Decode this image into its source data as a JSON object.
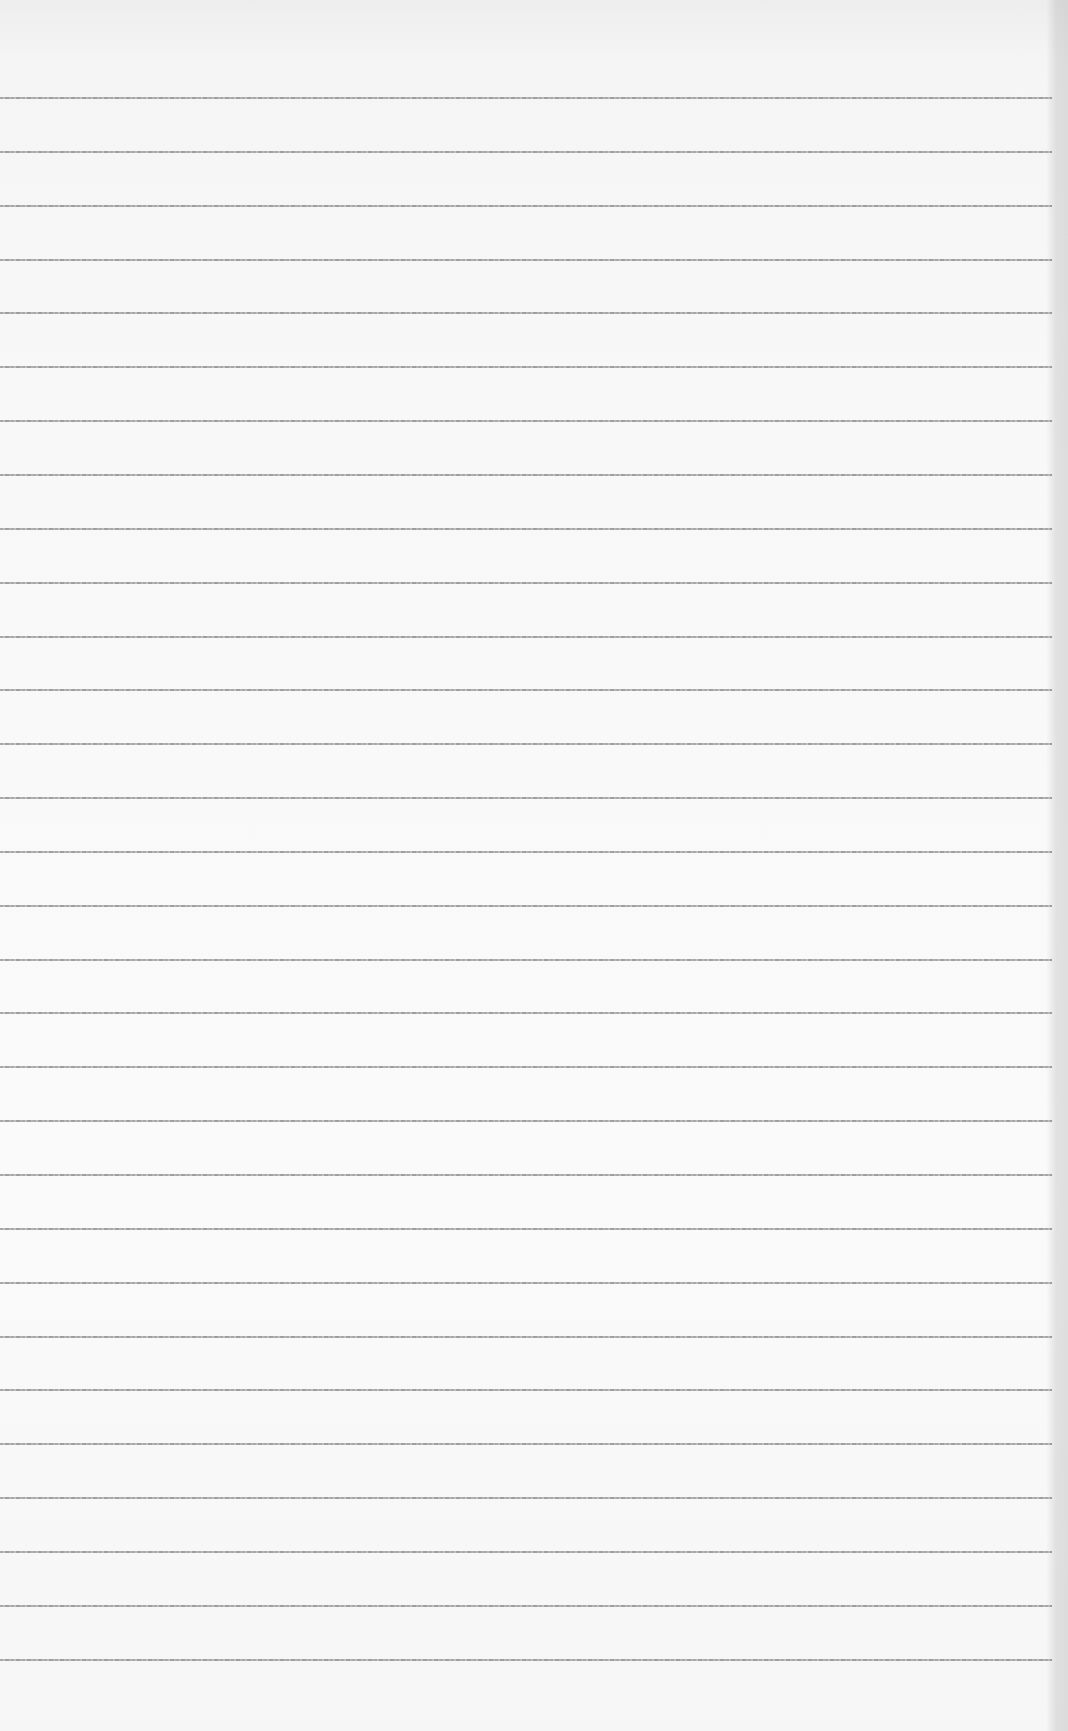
{
  "page": {
    "type": "lined-paper",
    "background": "#f7f7f7",
    "line_color": "#9e9e9e",
    "line_count": 30,
    "first_line_y": 97,
    "line_spacing": 53.85,
    "line_width": 1052,
    "text": ""
  }
}
